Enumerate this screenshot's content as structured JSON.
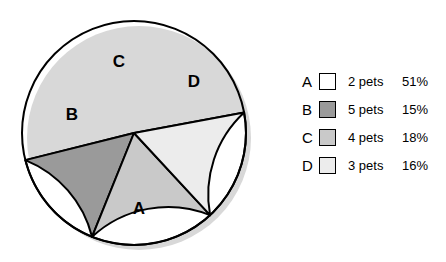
{
  "chart_data": {
    "type": "pie",
    "title": "",
    "subtitle": "",
    "xlabel": "",
    "ylabel": "",
    "legend_position": "right",
    "grid": false,
    "categories": [
      "A",
      "B",
      "C",
      "D"
    ],
    "values": [
      51,
      15,
      18,
      16
    ],
    "slices": [
      {
        "key": "A",
        "label": "A",
        "count_text": "2 pets",
        "count": 2,
        "percent": 51,
        "percent_text": "51%",
        "color": "#ffffff",
        "start_angle": 10.5,
        "end_angle": 194.0,
        "label_x": 139,
        "label_y": 210
      },
      {
        "key": "B",
        "label": "B",
        "count_text": "5 pets",
        "count": 5,
        "percent": 15,
        "percent_text": "15%",
        "color": "#9a9a9a",
        "start_angle": 194.0,
        "end_angle": 248.0,
        "label_x": 72,
        "label_y": 116
      },
      {
        "key": "C",
        "label": "C",
        "count_text": "4 pets",
        "count": 4,
        "percent": 18,
        "percent_text": "18%",
        "color": "#c9c9c9",
        "start_angle": 248.0,
        "end_angle": 312.8,
        "label_x": 119,
        "label_y": 63
      },
      {
        "key": "D",
        "label": "D",
        "count_text": "3 pets",
        "count": 3,
        "percent": 16,
        "percent_text": "16%",
        "color": "#ececec",
        "start_angle": 312.8,
        "end_angle": 370.5,
        "label_x": 194,
        "label_y": 83
      }
    ],
    "geometry": {
      "center_x": 134,
      "center_y": 133,
      "radius": 112,
      "outline_color": "#000000",
      "outline_width": 2,
      "shadow_color": "#d8d8d8",
      "shadow_offset_x": 5,
      "shadow_offset_y": 5
    }
  },
  "legend": {
    "rows": [
      {
        "key": "A",
        "count_text": "2 pets",
        "percent_text": "51%",
        "color": "#ffffff"
      },
      {
        "key": "B",
        "count_text": "5 pets",
        "percent_text": "15%",
        "color": "#9a9a9a"
      },
      {
        "key": "C",
        "count_text": "4 pets",
        "percent_text": "18%",
        "color": "#c9c9c9"
      },
      {
        "key": "D",
        "count_text": "3 pets",
        "percent_text": "16%",
        "color": "#ececec"
      }
    ]
  }
}
